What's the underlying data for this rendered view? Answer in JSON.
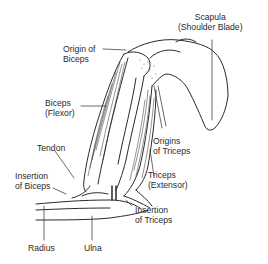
{
  "diagram": {
    "colors": {
      "line": "#2a2a2a",
      "background": "#ffffff",
      "shade": "#6a6a6a"
    },
    "labels": {
      "scapula": {
        "line1": "Scapula",
        "line2": "(Shoulder Blade)"
      },
      "origin_biceps": {
        "line1": "Origin of",
        "line2": "Biceps"
      },
      "biceps": {
        "line1": "Biceps",
        "line2": "(Flexor)"
      },
      "origins_triceps": {
        "line1": "Origins",
        "line2": "of Triceps"
      },
      "triceps": {
        "line1": "Triceps",
        "line2": "(Extensor)"
      },
      "tendon": {
        "line1": "Tendon"
      },
      "insertion_biceps": {
        "line1": "Insertion",
        "line2": "of Biceps"
      },
      "insertion_triceps": {
        "line1": "Insertion",
        "line2": "of Triceps"
      },
      "radius": {
        "line1": "Radius"
      },
      "ulna": {
        "line1": "Ulna"
      }
    }
  }
}
